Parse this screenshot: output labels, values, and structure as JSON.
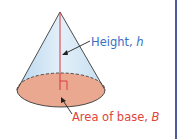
{
  "figure": {
    "shape": "cone",
    "labels": {
      "height": {
        "text": "Height, ",
        "variable": "h"
      },
      "base": {
        "text": "Area of base, ",
        "variable": "B"
      }
    },
    "colors": {
      "cone_side": "#cfe4f3",
      "base_fill": "#e9a88f",
      "height_line": "#d9333f",
      "height_label": "#3b6fc4",
      "base_label": "#e0443a",
      "border": "#4a5a9a"
    }
  }
}
